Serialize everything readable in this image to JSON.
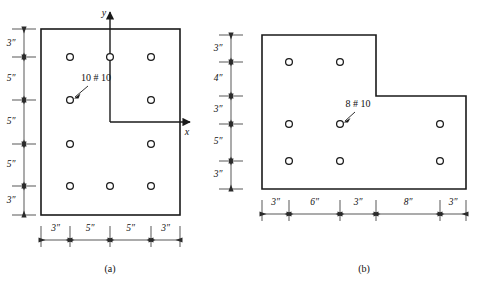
{
  "figure": {
    "title_a_caption": "(a)",
    "title_b_caption": "(b)",
    "units_symbol": "″"
  },
  "panel_a": {
    "caption": "(a)",
    "bar_note": "10 # 10",
    "axis_x_label": "x",
    "axis_y_label": "y",
    "vertical_dimensions": [
      "3″",
      "5″",
      "5″",
      "5″",
      "3″"
    ],
    "horizontal_dimensions": [
      "3″",
      "5″",
      "5″",
      "3″"
    ],
    "bar_count": 10,
    "bar_rows": [
      {
        "row": 1,
        "bars": 3
      },
      {
        "row": 2,
        "bars": 2
      },
      {
        "row": 3,
        "bars": 2
      },
      {
        "row": 4,
        "bars": 3
      }
    ]
  },
  "panel_b": {
    "caption": "(b)",
    "bar_note": "8 # 10",
    "vertical_dimensions": [
      "3″",
      "4″",
      "3″",
      "5″",
      "3″"
    ],
    "horizontal_dimensions": [
      "3″",
      "6″",
      "3″",
      "8″",
      "3″"
    ],
    "bar_count": 8,
    "bar_rows": [
      {
        "row": 1,
        "bars": 2
      },
      {
        "row": 2,
        "bars": 3
      },
      {
        "row": 3,
        "bars": 3
      }
    ]
  },
  "colors": {
    "outline": "#1a1a1a",
    "dimension": "#3a3a3a",
    "background": "#ffffff",
    "text": "#111111"
  }
}
